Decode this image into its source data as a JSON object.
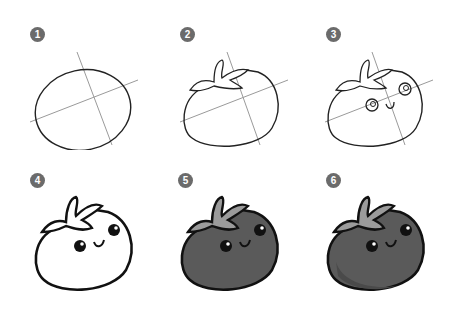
{
  "colors": {
    "badge": "#6b6b6b",
    "badge_text": "#ffffff",
    "guide_line": "#9a9a9a",
    "sketch_line": "#222222",
    "ink": "#111111",
    "body_fill": "#5a5a5a",
    "leaf_fill": "#9b9b9b",
    "highlight": "#ffffff"
  },
  "steps": [
    {
      "number": "1",
      "description": "Draw an oval with two crossing guide lines"
    },
    {
      "number": "2",
      "description": "Add the leafy stem on top"
    },
    {
      "number": "3",
      "description": "Sketch the eyes and smile"
    },
    {
      "number": "4",
      "description": "Ink the final outline"
    },
    {
      "number": "5",
      "description": "Color the tomato body and leaves"
    },
    {
      "number": "6",
      "description": "Add shading to finish"
    }
  ]
}
